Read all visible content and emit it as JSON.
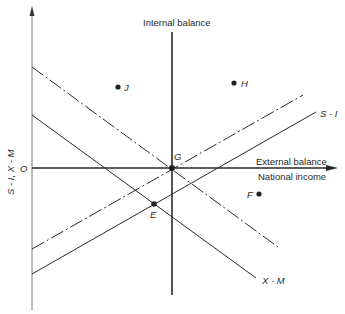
{
  "diagram": {
    "axes": {
      "y_label": "S - I, X - M",
      "x_label": "National income",
      "origin_label": "O"
    },
    "lines": {
      "internal_balance_label": "Internal balance",
      "external_balance_label": "External balance",
      "s_minus_i_label": "S - I",
      "x_minus_m_label": "X - M"
    },
    "points": {
      "G": "G",
      "E": "E",
      "J": "J",
      "H": "H",
      "F": "F"
    },
    "colors": {
      "line": "#2a2a2a",
      "axis": "#555555",
      "background": "#ffffff"
    }
  }
}
